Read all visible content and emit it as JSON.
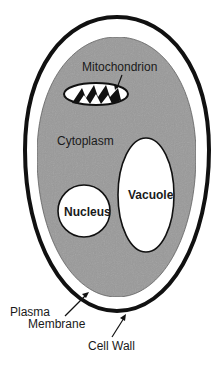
{
  "diagram": {
    "colors": {
      "cytoplasm": "#9a9a9a",
      "wall": "#111111",
      "background": "#ffffff",
      "organelle_fill": "#ffffff"
    },
    "labels": {
      "mitochondrion": "Mitochondrion",
      "cytoplasm": "Cytoplasm",
      "nucleus": "Nucleus",
      "vacuole": "Vacuole",
      "plasma_membrane_line1": "Plasma",
      "plasma_membrane_line2": "Membrane",
      "cell_wall": "Cell Wall"
    }
  }
}
